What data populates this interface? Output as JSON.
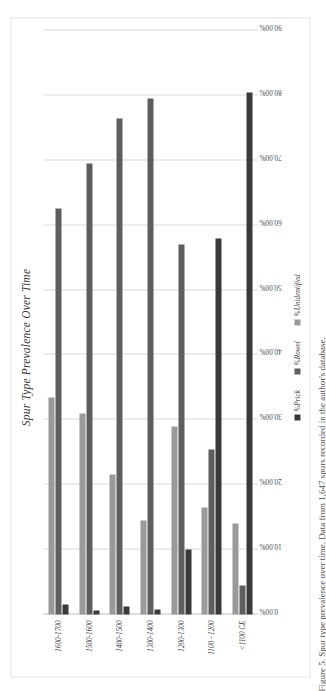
{
  "figure": {
    "caption": "Figure 5. Spur type prevalence over time. Data from 1,647 spurs recorded in the author's database."
  },
  "chart_data": {
    "type": "bar",
    "orientation": "horizontal",
    "title": "Spur Type Prevalence Over Time",
    "xlabel": "",
    "ylabel": "",
    "xlim": [
      0,
      90
    ],
    "xticks": [
      "0.00%",
      "10.00%",
      "20.00%",
      "30.00%",
      "40.00%",
      "50.00%",
      "60.00%",
      "70.00%",
      "80.00%",
      "90.00%"
    ],
    "xtick_values": [
      0,
      10,
      20,
      30,
      40,
      50,
      60,
      70,
      80,
      90
    ],
    "grid": true,
    "legend_position": "bottom",
    "categories": [
      "<1100 CE",
      "1100 - 1200",
      "1200-1300",
      "1300-1400",
      "1400-1500",
      "1500-1600",
      "1600-1700"
    ],
    "series": [
      {
        "name": "%Prick",
        "color": "#3a3a3a",
        "values": [
          80.5,
          58.0,
          10.0,
          0.8,
          1.2,
          0.6,
          1.5
        ]
      },
      {
        "name": "%Rowel",
        "color": "#5e5e5e",
        "values": [
          4.5,
          25.5,
          57.0,
          79.5,
          76.5,
          69.5,
          62.5
        ]
      },
      {
        "name": "%Unidentified",
        "color": "#9a9a9a",
        "values": [
          14.0,
          16.5,
          29.0,
          14.5,
          21.5,
          31.0,
          33.5
        ]
      }
    ]
  },
  "legend": {
    "items": [
      {
        "label": "%Prick",
        "color": "#3a3a3a"
      },
      {
        "label": "%Rowel",
        "color": "#5e5e5e"
      },
      {
        "label": "%Unidentified",
        "color": "#9a9a9a"
      }
    ]
  }
}
